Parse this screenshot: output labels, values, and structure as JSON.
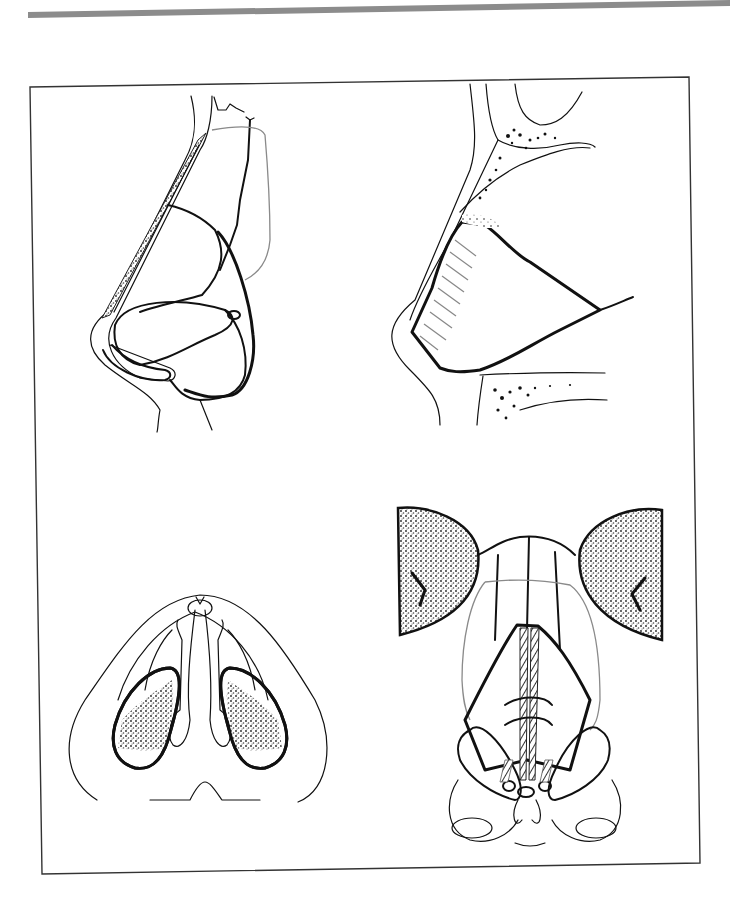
{
  "page": {
    "type": "scanned book page",
    "background": "#ffffff",
    "top_rule_color": "#8c8c8c",
    "frame_color": "#333333"
  },
  "figure": {
    "layout": "2x2 grid of anatomical line drawings inside a bordered frame",
    "panels": [
      {
        "position": "top-left",
        "view": "lateral view of nose with cartilage and stippled dorsal graft outline"
      },
      {
        "position": "top-right",
        "view": "sagittal section of nose with hatched septal cartilage and stippled bone"
      },
      {
        "position": "bottom-left",
        "view": "basal view of nose showing nostrils with stippled shading"
      },
      {
        "position": "bottom-right",
        "view": "frontal view of nasal framework with stippled orbits and midline struts"
      }
    ],
    "text_labels": []
  }
}
